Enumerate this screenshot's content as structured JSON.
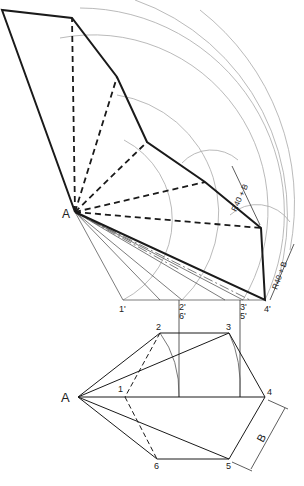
{
  "diagram": {
    "type": "pyramid surface development",
    "colors": {
      "ink": "#1a1a1a",
      "construction": "#9a9a9a",
      "background": "#ffffff"
    },
    "development": {
      "apex_label": "A",
      "dimension_labels": [
        "R40 + B",
        "R40 + B"
      ]
    },
    "true_length_baseline": {
      "labels": [
        "1'",
        "2'",
        "6'",
        "3'",
        "5'",
        "4'"
      ]
    },
    "plan_view": {
      "apex_label": "A",
      "vertex_labels": [
        "1",
        "2",
        "3",
        "4",
        "5",
        "6"
      ],
      "side_label": "B"
    }
  }
}
